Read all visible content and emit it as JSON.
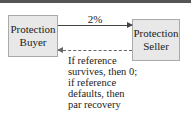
{
  "diagram": {
    "nodes": [
      {
        "id": "buyer",
        "label": "Protection Buyer"
      },
      {
        "id": "seller",
        "label": "Protection Seller"
      }
    ],
    "edges": [
      {
        "from": "buyer",
        "to": "seller",
        "label": "2%",
        "style": "solid"
      },
      {
        "from": "seller",
        "to": "buyer",
        "label": "If reference survives, then 0; if reference defaults, then par recovery",
        "style": "dashed"
      }
    ],
    "buyer_label": "Protection Buyer",
    "seller_label": "Protection Seller",
    "premium_label": "2%",
    "payoff_label": "If reference survives, then 0; if reference defaults, then par recovery"
  }
}
